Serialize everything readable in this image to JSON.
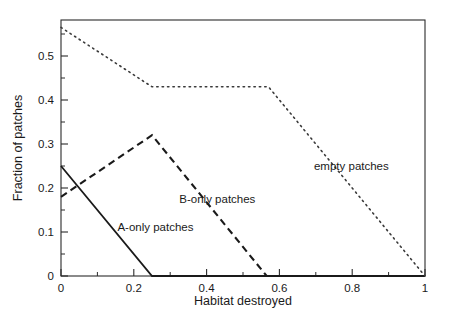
{
  "chart_data": {
    "type": "line",
    "title": "",
    "xlabel": "Habitat destroyed",
    "ylabel": "Fraction of patches",
    "xlim": [
      0,
      1
    ],
    "ylim": [
      0,
      0.58
    ],
    "grid": false,
    "legend_position": "inline-annotations",
    "x_ticks_major": [
      "0",
      "0.2",
      "0.4",
      "0.6",
      "0.8",
      "1"
    ],
    "x_ticks_major_values": [
      0,
      0.2,
      0.4,
      0.6,
      0.8,
      1
    ],
    "x_ticks_minor_values": [
      0.1,
      0.3,
      0.5,
      0.7,
      0.9
    ],
    "y_ticks_major": [
      "0",
      "0.1",
      "0.2",
      "0.3",
      "0.4",
      "0.5"
    ],
    "y_ticks_major_values": [
      0,
      0.1,
      0.2,
      0.3,
      0.4,
      0.5
    ],
    "y_ticks_minor_values": [
      0.05,
      0.15,
      0.25,
      0.35,
      0.45,
      0.55
    ],
    "series": [
      {
        "name": "A-only patches",
        "style": "solid",
        "x": [
          0,
          0.25,
          1
        ],
        "values": [
          0.25,
          0,
          0
        ],
        "label": "A-only patches",
        "label_x": 0.155,
        "label_y": 0.103
      },
      {
        "name": "B-only patches",
        "style": "dashed",
        "x": [
          0,
          0.25,
          0.565,
          1
        ],
        "values": [
          0.18,
          0.32,
          0,
          0
        ],
        "label": "B-only patches",
        "label_x": 0.325,
        "label_y": 0.166
      },
      {
        "name": "empty patches",
        "style": "dotted",
        "x": [
          0,
          0.25,
          0.57,
          1
        ],
        "values": [
          0.565,
          0.43,
          0.43,
          0
        ],
        "label": "empty patches",
        "label_x": 0.695,
        "label_y": 0.24
      }
    ]
  },
  "axes": {
    "x_title": "Habitat destroyed",
    "y_title": "Fraction of patches"
  },
  "colors": {
    "ink": "#1a1a1a",
    "axis": "#2b2b2b",
    "dotted": "#3a3a3a",
    "background": "#ffffff"
  }
}
